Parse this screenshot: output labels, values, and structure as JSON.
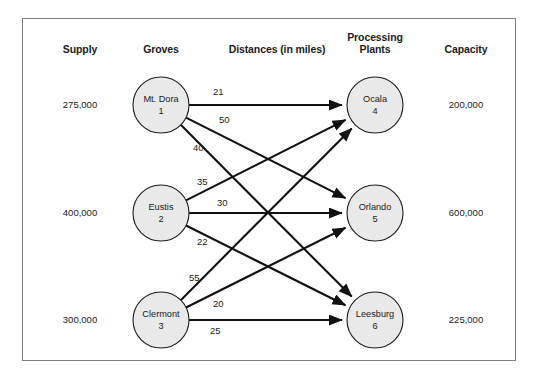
{
  "figure": {
    "border_color": "#7d7f81",
    "node_fill": "#e9e9e9",
    "node_stroke": "#1b1b1b",
    "edge_color": "#111111"
  },
  "headers": {
    "supply": "Supply",
    "groves": "Groves",
    "distances": "Distances (in miles)",
    "plants": "Processing\nPlants",
    "capacity": "Capacity"
  },
  "supply_nodes": [
    {
      "name": "Mt. Dora",
      "number": "1",
      "supply": "275,000",
      "cx": 161,
      "cy": 105
    },
    {
      "name": "Eustis",
      "number": "2",
      "supply": "400,000",
      "cx": 161,
      "cy": 213
    },
    {
      "name": "Clermont",
      "number": "3",
      "supply": "300,000",
      "cx": 161,
      "cy": 320
    }
  ],
  "demand_nodes": [
    {
      "name": "Ocala",
      "number": "4",
      "capacity": "200,000",
      "cx": 375,
      "cy": 105
    },
    {
      "name": "Orlando",
      "number": "5",
      "capacity": "600,000",
      "cx": 375,
      "cy": 213
    },
    {
      "name": "Leesburg",
      "number": "6",
      "capacity": "225,000",
      "cx": 375,
      "cy": 320
    }
  ],
  "edges": [
    {
      "from": "1",
      "to": "4",
      "distance": "21",
      "label_x": 213,
      "label_y": 86
    },
    {
      "from": "1",
      "to": "5",
      "distance": "50",
      "label_x": 219,
      "label_y": 114
    },
    {
      "from": "1",
      "to": "6",
      "distance": "40",
      "label_x": 193,
      "label_y": 142
    },
    {
      "from": "2",
      "to": "4",
      "distance": "35",
      "label_x": 197,
      "label_y": 176
    },
    {
      "from": "2",
      "to": "5",
      "distance": "30",
      "label_x": 217,
      "label_y": 197
    },
    {
      "from": "2",
      "to": "6",
      "distance": "22",
      "label_x": 197,
      "label_y": 236
    },
    {
      "from": "3",
      "to": "4",
      "distance": "55",
      "label_x": 189,
      "label_y": 272
    },
    {
      "from": "3",
      "to": "5",
      "distance": "20",
      "label_x": 213,
      "label_y": 298
    },
    {
      "from": "3",
      "to": "6",
      "distance": "25",
      "label_x": 210,
      "label_y": 325
    }
  ],
  "layout": {
    "node_radius": 28,
    "supply_col_x": 80,
    "capacity_col_x": 466,
    "header_y": 44
  }
}
